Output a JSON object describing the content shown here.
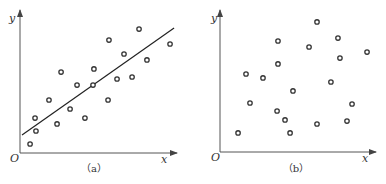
{
  "chart_data": [
    {
      "type": "scatter",
      "title": "",
      "caption": "（a）",
      "xlabel": "x",
      "ylabel": "y",
      "origin_label": "O",
      "xlim": [
        0,
        10
      ],
      "ylim": [
        0,
        10
      ],
      "grid": false,
      "ticks": false,
      "points": [
        [
          0.65,
          0.64
        ],
        [
          0.97,
          2.48
        ],
        [
          1.03,
          1.56
        ],
        [
          1.87,
          3.76
        ],
        [
          2.39,
          2.06
        ],
        [
          2.65,
          5.74
        ],
        [
          3.23,
          3.12
        ],
        [
          3.68,
          4.82
        ],
        [
          4.19,
          2.48
        ],
        [
          4.71,
          4.82
        ],
        [
          4.77,
          5.96
        ],
        [
          5.68,
          3.76
        ],
        [
          5.74,
          8.01
        ],
        [
          6.26,
          5.25
        ],
        [
          6.71,
          7.02
        ],
        [
          7.23,
          5.39
        ],
        [
          7.68,
          8.79
        ],
        [
          8.19,
          6.6
        ],
        [
          9.68,
          7.73
        ]
      ],
      "fit_line": {
        "from": [
          0.13,
          1.28
        ],
        "to": [
          9.94,
          8.87
        ]
      }
    },
    {
      "type": "scatter",
      "title": "",
      "caption": "（b）",
      "xlabel": "x",
      "ylabel": "y",
      "origin_label": "O",
      "xlim": [
        0,
        10
      ],
      "ylim": [
        0,
        10
      ],
      "grid": false,
      "ticks": false,
      "points": [
        [
          1.18,
          1.36
        ],
        [
          1.7,
          5.57
        ],
        [
          1.96,
          3.5
        ],
        [
          2.81,
          5.29
        ],
        [
          3.79,
          7.93
        ],
        [
          3.79,
          6.29
        ],
        [
          3.73,
          2.93
        ],
        [
          4.25,
          2.29
        ],
        [
          4.58,
          1.36
        ],
        [
          4.77,
          4.36
        ],
        [
          5.82,
          7.5
        ],
        [
          6.34,
          2.0
        ],
        [
          6.34,
          9.29
        ],
        [
          7.25,
          5.0
        ],
        [
          7.71,
          8.14
        ],
        [
          7.84,
          6.71
        ],
        [
          8.3,
          2.21
        ],
        [
          8.63,
          3.43
        ],
        [
          9.61,
          7.14
        ]
      ],
      "fit_line": null
    }
  ]
}
